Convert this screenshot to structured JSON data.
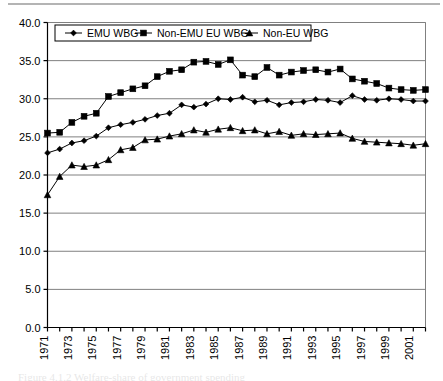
{
  "figure": {
    "background_color": "#ffffff",
    "line_color": "#000000",
    "gridline_color": "#808080",
    "axis_color": "#000000",
    "caption_partial": "Figure 4.1.2  Welfare-share of government spending"
  },
  "legend": {
    "position": "top-left-inside",
    "entries": [
      {
        "label": "EMU WBG",
        "marker": "diamond"
      },
      {
        "label": "Non-EMU EU WBG",
        "marker": "square"
      },
      {
        "label": "Non-EU WBG",
        "marker": "triangle"
      }
    ]
  },
  "chart_data": {
    "type": "line",
    "title": "",
    "subtitle": "",
    "xlabel": "",
    "ylabel": "",
    "xlim": [
      1971,
      2002
    ],
    "ylim": [
      0.0,
      40.0
    ],
    "ytick_step": 5.0,
    "grid": true,
    "legend_position": "upper left",
    "ytick_labels": [
      "0.0",
      "5.0",
      "10.0",
      "15.0",
      "20.0",
      "25.0",
      "30.0",
      "35.0",
      "40.0"
    ],
    "ytick_values": [
      0.0,
      5.0,
      10.0,
      15.0,
      20.0,
      25.0,
      30.0,
      35.0,
      40.0
    ],
    "x": [
      1971,
      1972,
      1973,
      1974,
      1975,
      1976,
      1977,
      1978,
      1979,
      1980,
      1981,
      1982,
      1983,
      1984,
      1985,
      1986,
      1987,
      1988,
      1989,
      1990,
      1991,
      1992,
      1993,
      1994,
      1995,
      1996,
      1997,
      1998,
      1999,
      2000,
      2001,
      2002
    ],
    "xtick_labels": [
      "1971",
      "1973",
      "1975",
      "1977",
      "1979",
      "1981",
      "1983",
      "1985",
      "1987",
      "1989",
      "1991",
      "1993",
      "1995",
      "1997",
      "1999",
      "2001"
    ],
    "xtick_label_values": [
      1971,
      1973,
      1975,
      1977,
      1979,
      1981,
      1983,
      1985,
      1987,
      1989,
      1991,
      1993,
      1995,
      1997,
      1999,
      2001
    ],
    "xtick_label_rotation": -90,
    "series": [
      {
        "name": "EMU WBG",
        "marker": "diamond",
        "values": [
          22.9,
          23.4,
          24.2,
          24.5,
          25.1,
          26.2,
          26.6,
          26.9,
          27.3,
          27.8,
          28.1,
          29.2,
          28.9,
          29.3,
          30.0,
          29.9,
          30.2,
          29.6,
          29.8,
          29.2,
          29.5,
          29.6,
          29.9,
          29.8,
          29.5,
          30.4,
          29.9,
          29.8,
          30.0,
          29.9,
          29.7,
          29.7
        ]
      },
      {
        "name": "Non-EMU EU WBG",
        "marker": "square",
        "values": [
          25.5,
          25.6,
          26.9,
          27.7,
          28.1,
          30.3,
          30.8,
          31.3,
          31.7,
          32.9,
          33.6,
          33.8,
          34.8,
          34.9,
          34.5,
          35.1,
          33.1,
          32.9,
          34.1,
          33.1,
          33.5,
          33.7,
          33.8,
          33.5,
          33.9,
          32.6,
          32.3,
          32.0,
          31.4,
          31.2,
          31.1,
          31.2
        ]
      },
      {
        "name": "Non-EU WBG",
        "marker": "triangle",
        "values": [
          17.4,
          19.8,
          21.3,
          21.1,
          21.3,
          22.0,
          23.3,
          23.6,
          24.6,
          24.7,
          25.1,
          25.4,
          25.9,
          25.6,
          26.0,
          26.2,
          25.8,
          25.9,
          25.4,
          25.7,
          25.2,
          25.4,
          25.3,
          25.4,
          25.5,
          24.8,
          24.4,
          24.3,
          24.2,
          24.1,
          23.9,
          24.1
        ]
      }
    ]
  }
}
